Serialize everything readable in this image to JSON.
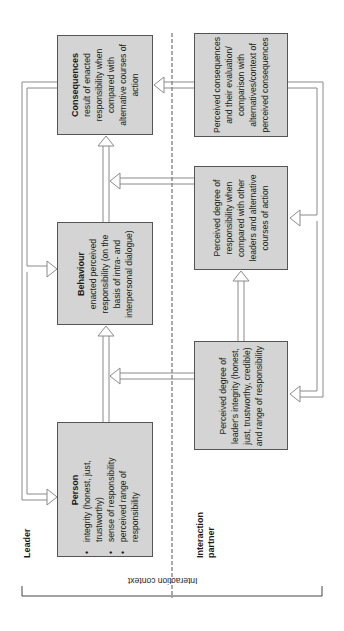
{
  "diagram": {
    "orientation": "rotated -90deg",
    "colors": {
      "box_fill": "#d4d4d4",
      "box_border": "#555555",
      "arrow": "#8a8a8a",
      "divider": "#555555"
    },
    "sections": {
      "leader": "Leader",
      "partner_line1": "Interaction",
      "partner_line2": "partner",
      "context": "Interaction context"
    },
    "leader_boxes": {
      "person": {
        "title": "Person",
        "bullets": [
          "integrity (honest, just, trustworthy)",
          "sense of responsibility",
          "perceived range of responsibility"
        ]
      },
      "behaviour": {
        "title": "Behaviour",
        "text": "enacted perceived responsibility (on the basis of intra- and interpersonal dialogue)"
      },
      "consequences": {
        "title": "Consequences",
        "text": "result of enacted responsibility when compared with alternative courses of action"
      }
    },
    "partner_boxes": {
      "integrity": {
        "text": "Perceived degree of leader's integrity (honest, just, trustworthy, credible) and range of responsibility"
      },
      "responsibility": {
        "text": "Perceived degree of responsibility when compared with other leaders and alternative courses of action"
      },
      "consequences": {
        "text": "Perceived consequences and their evaluation/ comparison with alternatives/context of perceived consequences"
      }
    },
    "arrows": [
      "person -> behaviour",
      "behaviour -> consequences",
      "consequences -> behaviour (feedback)",
      "consequences -> person (feedback)",
      "partner.integrity -> person-behaviour link",
      "partner.integrity -> partner.responsibility",
      "partner.responsibility -> behaviour-consequences link",
      "partner.consequences -> consequences",
      "partner.consequences -> partner.responsibility (feedback)",
      "partner.consequences -> partner.integrity (feedback)"
    ]
  }
}
